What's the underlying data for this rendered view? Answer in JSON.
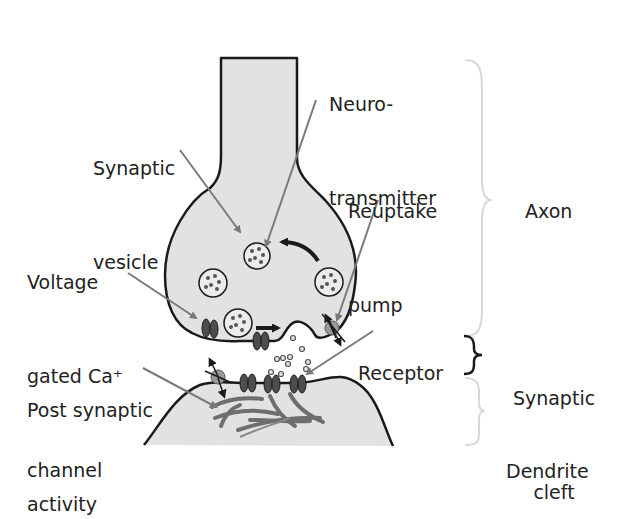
{
  "diagram": {
    "type": "synapse-illustration",
    "colors": {
      "cell_fill": "#e2e2e2",
      "outline": "#1a1a1a",
      "pointer": "#7a7a7a",
      "channel": "#4d4d4d",
      "receptor_pump": "#9a9a9a",
      "brace": "#d8d8d8",
      "cleft_brace": "#1a1a1a",
      "text": "#222222"
    },
    "labels": {
      "neurotransmitter_line1": "Neuro-",
      "neurotransmitter_line2": "transmitter",
      "synaptic_vesicle_line1": "Synaptic",
      "synaptic_vesicle_line2": "vesicle",
      "reuptake_line1": "Reuptake",
      "reuptake_line2": "pump",
      "voltage_line1": "Voltage",
      "voltage_line2": "gated Ca⁺",
      "voltage_line3": "channel",
      "receptor": "Receptor",
      "post_synaptic_line1": "Post synaptic",
      "post_synaptic_line2": "activity"
    },
    "regions": {
      "axon": "Axon",
      "cleft_line1": "Synaptic",
      "cleft_line2": "cleft",
      "dendrite": "Dendrite"
    }
  }
}
